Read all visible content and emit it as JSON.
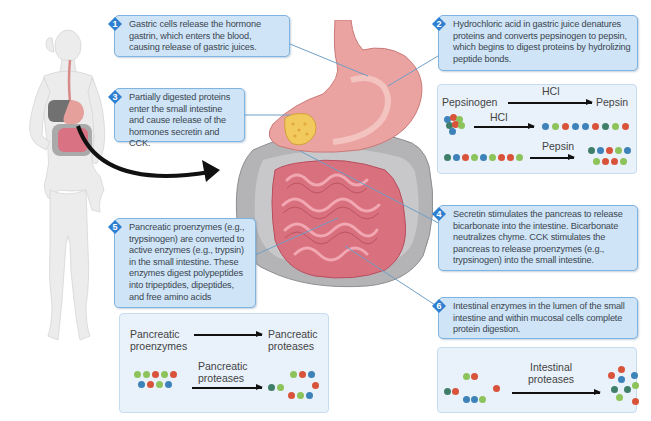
{
  "figure": {
    "title": "Protein digestion",
    "colors": {
      "callout_bg": "#cfe4f7",
      "callout_border": "#7fb3e0",
      "badge": "#2f7fd0",
      "panel_bg": "#e9f2fb",
      "bead_blue": "#3d82b8",
      "bead_green": "#8cc35a",
      "bead_red": "#d9533b",
      "bead_teal": "#3f7f6a",
      "leader_line": "#6f9fc7",
      "stomach": "#eaa3a0",
      "intestine": "#d96b7a",
      "colon": "#a9a9ab"
    }
  },
  "callouts": [
    {
      "number": "1",
      "text": "Gastric cells release the hormone gastrin, which enters the blood, causing release of gastric juices."
    },
    {
      "number": "2",
      "text": "Hydrochloric acid in gastric juice denatures proteins and converts pepsinogen to pepsin, which begins to digest proteins by hydrolizing peptide bonds."
    },
    {
      "number": "3",
      "text": "Partially digested proteins enter the small intestine and cause release of the hormones secretin and CCK."
    },
    {
      "number": "4",
      "text": "Secretin stimulates the pancreas to release bicarbonate into the intestine. Bicarbonate neutralizes chyme. CCK stimulates the pancreas to release proenzymes (e.g., trypsinogen) into the small intestine."
    },
    {
      "number": "5",
      "text": "Pancreatic proenzymes (e.g., trypsinogen) are converted to active enzymes (e.g., trypsin) in the small intestine. These enzymes digest polypeptides into tripeptides, dipeptides, and free amino acids"
    },
    {
      "number": "6",
      "text": "Intestinal enzymes in the lumen of the small intestine and within mucosal cells complete protein digestion."
    }
  ],
  "panels": {
    "stomach": {
      "row1": {
        "from": "Pepsinogen",
        "over": "HCl",
        "to": "Pepsin"
      },
      "row2": {
        "over": "HCl"
      },
      "row3": {
        "over": "Pepsin"
      }
    },
    "pancreatic": {
      "row1": {
        "from_line1": "Pancreatic",
        "from_line2": "proenzymes",
        "to_line1": "Pancreatic",
        "to_line2": "proteases"
      },
      "row2": {
        "over_line1": "Pancreatic",
        "over_line2": "proteases"
      }
    },
    "intestinal": {
      "row1": {
        "over_line1": "Intestinal",
        "over_line2": "proteases"
      }
    }
  },
  "illustration": {
    "body_figure": "female-body-outline",
    "organs": [
      "esophagus",
      "stomach",
      "pancreas",
      "small-intestine",
      "large-intestine"
    ]
  }
}
